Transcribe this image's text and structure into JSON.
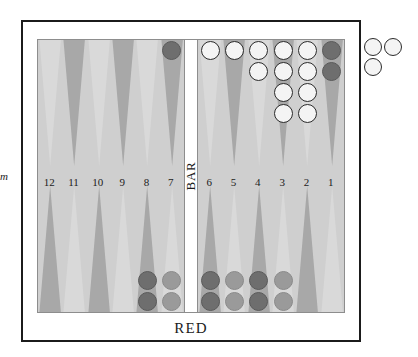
{
  "page": {
    "width": 418,
    "height": 357,
    "background": "#ffffff",
    "edge_glyph": "m"
  },
  "board": {
    "top_player_label": "WHITE",
    "bottom_player_label": "RED",
    "bar_label": "BAR",
    "frame_color": "#1b1b1b",
    "field_color": "#cfcfcf",
    "point_light_color": "#d9d9d9",
    "point_dark_color": "#a8a8a8",
    "white_checker_color": "#f4f4f4",
    "red_checker_color": "#6e6e6e",
    "red_checker_light_color": "#9a9a9a",
    "point_numbers_left": [
      "12",
      "11",
      "10",
      "9",
      "8",
      "7"
    ],
    "point_numbers_right": [
      "6",
      "5",
      "4",
      "3",
      "2",
      "1"
    ]
  },
  "points": {
    "top_left": [
      {
        "number": "12",
        "shade": "light",
        "checkers": 0,
        "color": ""
      },
      {
        "number": "11",
        "shade": "dark",
        "checkers": 0,
        "color": ""
      },
      {
        "number": "10",
        "shade": "light",
        "checkers": 0,
        "color": ""
      },
      {
        "number": "9",
        "shade": "dark",
        "checkers": 0,
        "color": ""
      },
      {
        "number": "8",
        "shade": "light",
        "checkers": 0,
        "color": ""
      },
      {
        "number": "7",
        "shade": "dark",
        "checkers": 1,
        "color": "red"
      }
    ],
    "top_right": [
      {
        "number": "6",
        "shade": "light",
        "checkers": 1,
        "color": "white"
      },
      {
        "number": "5",
        "shade": "dark",
        "checkers": 1,
        "color": "white"
      },
      {
        "number": "4",
        "shade": "light",
        "checkers": 2,
        "color": "white"
      },
      {
        "number": "3",
        "shade": "dark",
        "checkers": 4,
        "color": "white"
      },
      {
        "number": "2",
        "shade": "light",
        "checkers": 4,
        "color": "white"
      },
      {
        "number": "1",
        "shade": "dark",
        "checkers": 2,
        "color": "red"
      }
    ],
    "bottom_left": [
      {
        "number": "12",
        "shade": "dark",
        "checkers": 0,
        "color": ""
      },
      {
        "number": "11",
        "shade": "light",
        "checkers": 0,
        "color": ""
      },
      {
        "number": "10",
        "shade": "dark",
        "checkers": 0,
        "color": ""
      },
      {
        "number": "9",
        "shade": "light",
        "checkers": 0,
        "color": ""
      },
      {
        "number": "8",
        "shade": "dark",
        "checkers": 2,
        "color": "red"
      },
      {
        "number": "7",
        "shade": "light",
        "checkers": 2,
        "color": "red-light"
      }
    ],
    "bottom_right": [
      {
        "number": "6",
        "shade": "dark",
        "checkers": 2,
        "color": "red"
      },
      {
        "number": "5",
        "shade": "light",
        "checkers": 2,
        "color": "red-light"
      },
      {
        "number": "4",
        "shade": "dark",
        "checkers": 2,
        "color": "red"
      },
      {
        "number": "3",
        "shade": "light",
        "checkers": 2,
        "color": "red-light"
      },
      {
        "number": "2",
        "shade": "dark",
        "checkers": 0,
        "color": ""
      },
      {
        "number": "1",
        "shade": "light",
        "checkers": 0,
        "color": ""
      }
    ]
  },
  "borne_off": {
    "color": "white",
    "count": 3,
    "positions": [
      {
        "x": 0,
        "y": 0
      },
      {
        "x": 20,
        "y": 0
      },
      {
        "x": 0,
        "y": 20
      }
    ]
  }
}
